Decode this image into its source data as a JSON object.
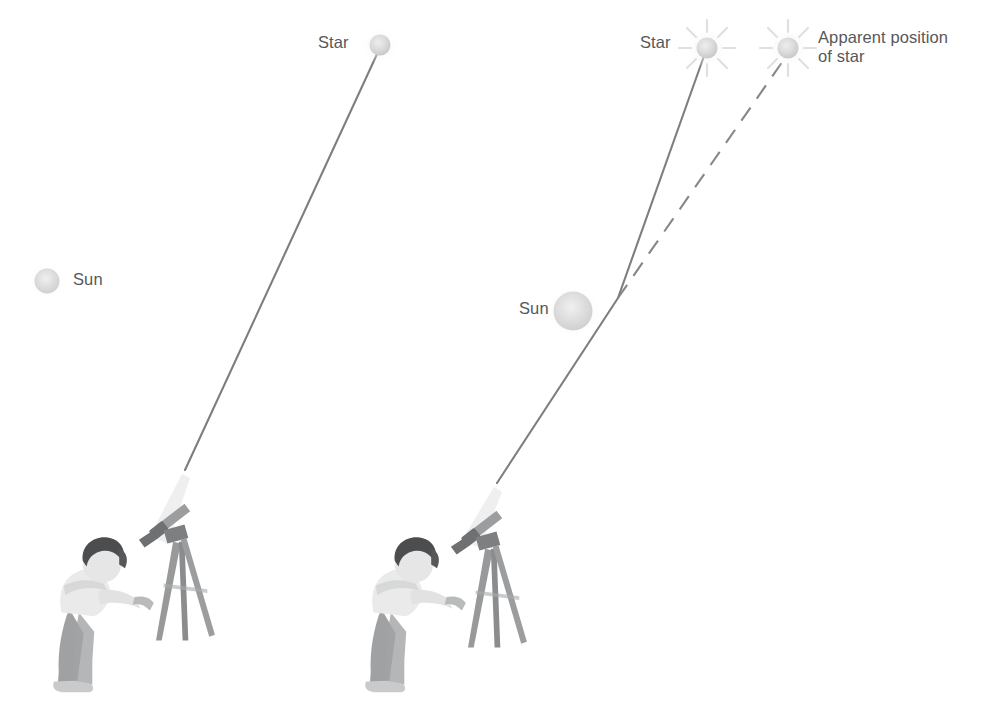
{
  "figure": {
    "background_color": "#ffffff",
    "width": 995,
    "height": 704
  },
  "style": {
    "label_color": "#57585a",
    "ray_color": "#7c7e80",
    "dashed_ray_color": "#85878a",
    "star_color": "#d8d9da",
    "sun_color": "#dcdcdc",
    "telescope_color": "#e8e8e8",
    "figure_color": "#8b8d8f"
  },
  "labels": {
    "left_star": "Star",
    "left_sun": "Sun",
    "right_star": "Star",
    "right_sun": "Sun",
    "apparent_position_line1": "Apparent position",
    "apparent_position_line2": "of star"
  },
  "panels": [
    {
      "name": "undeflected",
      "description": "Star observed when the Sun is far from the line of sight; light travels in a straight line to the telescope.",
      "star": {
        "x": 380,
        "y": 45,
        "radius": 11,
        "rays": false
      },
      "sun": {
        "x": 47,
        "y": 281,
        "radius": 13
      },
      "observer": {
        "x": 60,
        "y": 530,
        "width": 150,
        "height": 170
      },
      "telescope_tip": {
        "x": 185,
        "y": 470
      },
      "rays": [
        {
          "type": "solid",
          "points": [
            [
              185,
              470
            ],
            [
              378,
              52
            ]
          ]
        }
      ]
    },
    {
      "name": "deflected",
      "description": "Starlight grazing the Sun is bent, so the star appears shifted away from the Sun.",
      "star": {
        "x": 707,
        "y": 48,
        "radius": 11,
        "rays": true
      },
      "apparent_star": {
        "x": 788,
        "y": 48,
        "radius": 11,
        "rays": true
      },
      "sun": {
        "x": 573,
        "y": 311,
        "radius": 20
      },
      "observer": {
        "x": 372,
        "y": 530,
        "width": 150,
        "height": 170
      },
      "telescope_tip": {
        "x": 497,
        "y": 483
      },
      "bend_point": {
        "x": 618,
        "y": 298
      },
      "rays": [
        {
          "type": "solid",
          "points": [
            [
              497,
              483
            ],
            [
              618,
              298
            ],
            [
              704,
              56
            ]
          ]
        },
        {
          "type": "dashed",
          "points": [
            [
              618,
              298
            ],
            [
              785,
              58
            ]
          ]
        }
      ]
    }
  ]
}
